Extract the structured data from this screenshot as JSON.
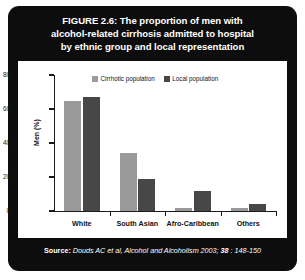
{
  "figure": {
    "title_lines": [
      "FIGURE 2.6: The proportion of men with",
      "alcohol-related cirrhosis admitted to hospital",
      "by ethnic group and local representation"
    ],
    "source": {
      "label": "Source:",
      "citation": "Douds AC et al, Alcohol and Alcoholism 2003;",
      "volume": "38",
      "pages": ": 148-150"
    },
    "colors": {
      "card_background": "#0d0d0d",
      "panel_background": "#ffffff",
      "title_text": "#ffffff",
      "series_cirrhotic": "#9a9a9a",
      "series_local": "#474747",
      "axis": "#1a1a1a"
    }
  },
  "chart_data": {
    "type": "bar",
    "title": "",
    "xlabel": "",
    "ylabel": "Men (%)",
    "ylim": [
      0,
      80
    ],
    "yticks": [
      0,
      20,
      40,
      60,
      80
    ],
    "ytick_labels": [
      "0",
      "20",
      "40",
      "60",
      "80"
    ],
    "grid": false,
    "legend_position": "top-center",
    "categories": [
      "White",
      "South Asian",
      "Afro-Caribbean",
      "Others"
    ],
    "series": [
      {
        "name": "Cirrhotic population",
        "color": "#9a9a9a",
        "values": [
          65,
          34,
          2,
          1.5
        ]
      },
      {
        "name": "Local population",
        "color": "#474747",
        "values": [
          67,
          19,
          12,
          4
        ]
      }
    ]
  }
}
